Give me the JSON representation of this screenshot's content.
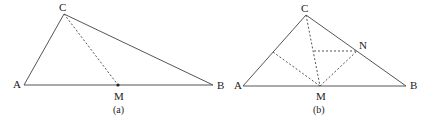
{
  "figures": [
    {
      "caption": "(a)",
      "labels": {
        "A": "A",
        "B": "B",
        "C": "C",
        "M": "M"
      },
      "points": {
        "A": [
          24,
          85
        ],
        "B": [
          213,
          85
        ],
        "C": [
          64,
          14
        ],
        "M": [
          118,
          85
        ]
      },
      "solid_segments": [
        [
          "A",
          "B"
        ],
        [
          "A",
          "C"
        ],
        [
          "C",
          "B"
        ]
      ],
      "dashed_segments": [
        [
          "C",
          "M"
        ]
      ],
      "marked_points": [
        "M"
      ]
    },
    {
      "caption": "(b)",
      "labels": {
        "A": "A",
        "B": "B",
        "C": "C",
        "M": "M",
        "N": "N"
      },
      "points": {
        "A": [
          243,
          86
        ],
        "B": [
          406,
          86
        ],
        "C": [
          306,
          15
        ],
        "M": [
          320,
          86
        ],
        "N": [
          357,
          51
        ],
        "P": [
          273,
          52
        ],
        "Q": [
          314,
          51
        ]
      },
      "solid_segments": [
        [
          "A",
          "B"
        ],
        [
          "A",
          "C"
        ],
        [
          "C",
          "B"
        ]
      ],
      "dashed_segments": [
        [
          "C",
          "M"
        ],
        [
          "M",
          "N"
        ],
        [
          "M",
          "P"
        ],
        [
          "Q",
          "N"
        ]
      ],
      "marked_points": []
    }
  ],
  "colors": {
    "line": "#555555",
    "text": "#222222",
    "background": "#ffffff"
  }
}
